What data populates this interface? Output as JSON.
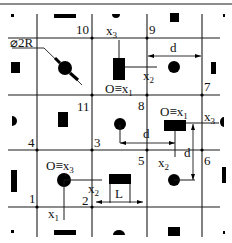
{
  "diagram": {
    "type": "grid-layout-schematic",
    "colors": {
      "line": "#1a1a1a",
      "fill": "#000000",
      "background": "#ffffff"
    },
    "grid": {
      "vertical_x": [
        37,
        92,
        147,
        202
      ],
      "horizontal_y": [
        38,
        95,
        150,
        207
      ]
    },
    "nodes": [
      {
        "id": "1",
        "label": "1",
        "x": 37,
        "y": 207
      },
      {
        "id": "2",
        "label": "2",
        "x": 92,
        "y": 207
      },
      {
        "id": "3",
        "label": "3",
        "x": 92,
        "y": 150
      },
      {
        "id": "4",
        "label": "4",
        "x": 37,
        "y": 150
      },
      {
        "id": "5",
        "label": "5",
        "x": 147,
        "y": 150
      },
      {
        "id": "6",
        "label": "6",
        "x": 202,
        "y": 150
      },
      {
        "id": "7",
        "label": "7",
        "x": 202,
        "y": 95
      },
      {
        "id": "8",
        "label": "8",
        "x": 147,
        "y": 95
      },
      {
        "id": "9",
        "label": "9",
        "x": 147,
        "y": 38
      },
      {
        "id": "10",
        "label": "10",
        "x": 92,
        "y": 38
      },
      {
        "id": "11",
        "label": "11",
        "x": 92,
        "y": 95
      }
    ],
    "labels": {
      "diameter": "⌀2R",
      "origin_x1": "O≡x",
      "origin_x1_sub": "1",
      "origin_x3": "O≡x",
      "origin_x3_sub": "3",
      "x": "x",
      "sub1": "1",
      "sub2": "2",
      "sub3": "3",
      "d": "d",
      "L": "L"
    }
  }
}
